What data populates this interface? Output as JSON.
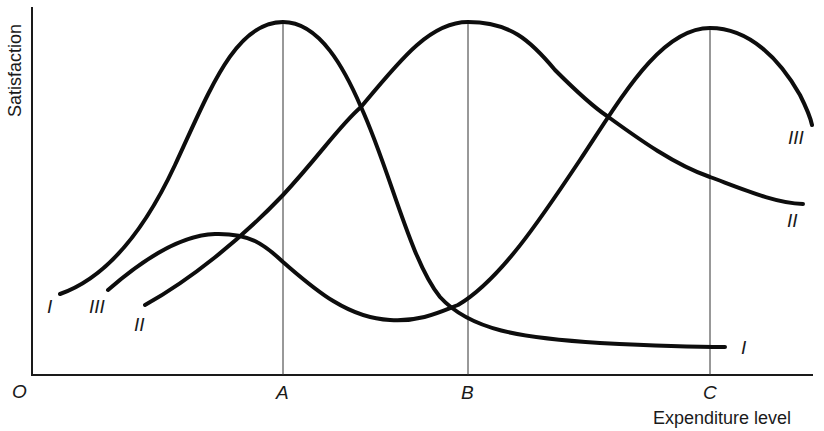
{
  "diagram": {
    "y_axis_label": "Satisfaction",
    "x_axis_label": "Expenditure level",
    "origin_label": "O",
    "x_ticks": [
      {
        "label": "A"
      },
      {
        "label": "B"
      },
      {
        "label": "C"
      }
    ],
    "curves": [
      {
        "id": "I",
        "start_label": "I",
        "end_label": "I",
        "peak_at": "A"
      },
      {
        "id": "II",
        "start_label": "II",
        "end_label": "II",
        "peak_at": "B"
      },
      {
        "id": "III",
        "start_label": "III",
        "end_label": "III",
        "peak_at": "C"
      }
    ]
  }
}
